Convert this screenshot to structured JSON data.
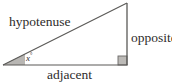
{
  "diagram": {
    "kind": "right-triangle-trigonometry",
    "background_color": "#ffffff",
    "stroke_color": "#5a5957",
    "fill_color": "#b9b7b4",
    "text_color": "#2e2c2b",
    "labels": {
      "hypotenuse": "hypotenuse",
      "opposite": "opposite",
      "adjacent": "adjacent",
      "angle_variable": "x",
      "angle_degree_symbol": "°"
    },
    "geometry": {
      "vertex_left": {
        "x": 3,
        "y": 65
      },
      "vertex_bottom_right": {
        "x": 127,
        "y": 65
      },
      "vertex_top_right": {
        "x": 127,
        "y": 3
      },
      "right_angle_marker": {
        "size": 9,
        "corner": "bottom-right",
        "filled": true
      },
      "angle_arc": {
        "at": "vertex_left",
        "radius": 22,
        "filled": true
      }
    }
  }
}
